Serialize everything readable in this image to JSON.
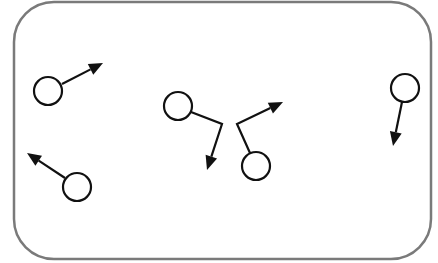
{
  "diagram": {
    "container": {
      "x": 14,
      "y": 2,
      "width": 417,
      "height": 257,
      "radius": 40,
      "stroke": "#7a7a7a",
      "stroke_width": 2.5
    },
    "style": {
      "particle_stroke": "#111111",
      "arrow_color": "#111111",
      "background": "#ffffff"
    },
    "particles": [
      {
        "id": "p1",
        "cx": 48,
        "cy": 91,
        "r": 14,
        "path": [
          [
            62,
            84
          ],
          [
            103,
            63
          ]
        ]
      },
      {
        "id": "p2",
        "cx": 178,
        "cy": 106,
        "r": 14,
        "path": [
          [
            191,
            112
          ],
          [
            222,
            124
          ],
          [
            207,
            170
          ]
        ]
      },
      {
        "id": "p3",
        "cx": 256,
        "cy": 166,
        "r": 14,
        "path": [
          [
            250,
            153
          ],
          [
            237,
            124
          ],
          [
            283,
            102
          ]
        ]
      },
      {
        "id": "p4",
        "cx": 405,
        "cy": 88,
        "r": 14,
        "path": [
          [
            402,
            102
          ],
          [
            393,
            146
          ]
        ]
      },
      {
        "id": "p5",
        "cx": 77,
        "cy": 187,
        "r": 14,
        "path": [
          [
            65,
            178
          ],
          [
            27,
            153
          ]
        ]
      }
    ]
  }
}
